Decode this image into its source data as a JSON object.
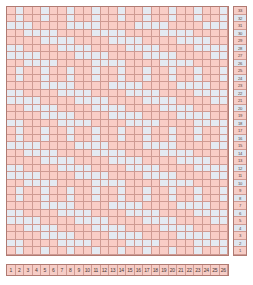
{
  "colors": {
    "warp": "#f9cdc6",
    "weft": "#e4eaf2",
    "grid_line": "#cf9a92",
    "border": "#b07a72",
    "ruler_odd": "#f6cdc6",
    "ruler_even": "#dfe6ef",
    "text": "#4a3734",
    "background": "#ffffff"
  },
  "grid": {
    "columns": 26,
    "rows": 33,
    "cell_width_px": 8.5,
    "cell_height_px": 7.5,
    "legend": {
      "warp_label": "warp (pink)",
      "weft_label": "weft (light blue)"
    }
  },
  "column_ruler": {
    "name": "column-numbers",
    "labels": [
      "1",
      "2",
      "3",
      "4",
      "5",
      "6",
      "7",
      "8",
      "9",
      "10",
      "11",
      "12",
      "13",
      "14",
      "15",
      "16",
      "17",
      "18",
      "19",
      "20",
      "21",
      "22",
      "23",
      "24",
      "25",
      "26"
    ]
  },
  "row_ruler": {
    "name": "row-numbers",
    "labels": [
      "33",
      "32",
      "31",
      "30",
      "29",
      "28",
      "27",
      "26",
      "25",
      "24",
      "23",
      "22",
      "21",
      "20",
      "19",
      "18",
      "17",
      "16",
      "15",
      "14",
      "13",
      "12",
      "11",
      "10",
      "9",
      "8",
      "7",
      "6",
      "5",
      "4",
      "3",
      "2",
      "1"
    ]
  },
  "chart_data": {
    "type": "heatmap",
    "xlabel": "",
    "ylabel": "",
    "categories": [
      "1",
      "2",
      "3",
      "4",
      "5",
      "6",
      "7",
      "8",
      "9",
      "10",
      "11",
      "12",
      "13",
      "14",
      "15",
      "16",
      "17",
      "18",
      "19",
      "20",
      "21",
      "22",
      "23",
      "24",
      "25",
      "26"
    ],
    "value_map": {
      "1": "warp",
      "0": "weft"
    },
    "matrix": [
      [
        1,
        0,
        1,
        1,
        0,
        1,
        1,
        0,
        1,
        1,
        0,
        1,
        1,
        0,
        1,
        1,
        0,
        1,
        1,
        0,
        1,
        1,
        0,
        1,
        1,
        0
      ],
      [
        1,
        0,
        1,
        1,
        0,
        1,
        1,
        0,
        1,
        1,
        0,
        1,
        1,
        0,
        1,
        1,
        0,
        1,
        1,
        0,
        1,
        1,
        0,
        1,
        1,
        0
      ],
      [
        0,
        0,
        0,
        1,
        1,
        1,
        1,
        0,
        0,
        0,
        0,
        1,
        1,
        1,
        1,
        0,
        0,
        0,
        0,
        1,
        1,
        1,
        1,
        0,
        0,
        0
      ],
      [
        1,
        1,
        0,
        0,
        0,
        0,
        1,
        1,
        1,
        1,
        0,
        0,
        0,
        0,
        1,
        1,
        1,
        1,
        0,
        0,
        0,
        0,
        1,
        1,
        1,
        1
      ],
      [
        1,
        1,
        1,
        1,
        0,
        0,
        0,
        0,
        1,
        1,
        1,
        1,
        0,
        0,
        0,
        0,
        1,
        1,
        1,
        1,
        0,
        0,
        0,
        0,
        1,
        1
      ],
      [
        0,
        0,
        1,
        1,
        1,
        1,
        0,
        0,
        0,
        0,
        1,
        1,
        1,
        1,
        0,
        0,
        0,
        0,
        1,
        1,
        1,
        1,
        0,
        0,
        0,
        0
      ],
      [
        0,
        0,
        0,
        0,
        1,
        1,
        1,
        1,
        0,
        0,
        0,
        0,
        1,
        1,
        1,
        1,
        0,
        0,
        0,
        0,
        1,
        1,
        1,
        1,
        0,
        0
      ],
      [
        1,
        1,
        0,
        0,
        0,
        0,
        1,
        1,
        1,
        1,
        0,
        0,
        0,
        0,
        1,
        1,
        1,
        1,
        0,
        0,
        0,
        0,
        1,
        1,
        1,
        1
      ],
      [
        1,
        0,
        1,
        1,
        0,
        1,
        1,
        0,
        1,
        1,
        0,
        1,
        1,
        0,
        1,
        1,
        0,
        1,
        1,
        0,
        1,
        1,
        0,
        1,
        1,
        0
      ],
      [
        1,
        0,
        1,
        1,
        0,
        1,
        1,
        0,
        1,
        1,
        0,
        1,
        1,
        0,
        1,
        1,
        0,
        1,
        1,
        0,
        1,
        1,
        0,
        1,
        1,
        0
      ],
      [
        1,
        1,
        1,
        1,
        0,
        0,
        0,
        0,
        1,
        1,
        1,
        1,
        0,
        0,
        0,
        0,
        1,
        1,
        1,
        1,
        0,
        0,
        0,
        0,
        1,
        1
      ],
      [
        0,
        0,
        1,
        1,
        1,
        1,
        0,
        0,
        0,
        0,
        1,
        1,
        1,
        1,
        0,
        0,
        0,
        0,
        1,
        1,
        1,
        1,
        0,
        0,
        0,
        0
      ],
      [
        0,
        0,
        0,
        0,
        1,
        1,
        1,
        1,
        0,
        0,
        0,
        0,
        1,
        1,
        1,
        1,
        0,
        0,
        0,
        0,
        1,
        1,
        1,
        1,
        0,
        0
      ],
      [
        1,
        1,
        0,
        0,
        0,
        0,
        1,
        1,
        1,
        1,
        0,
        0,
        0,
        0,
        1,
        1,
        1,
        1,
        0,
        0,
        0,
        0,
        1,
        1,
        1,
        1
      ],
      [
        1,
        1,
        1,
        1,
        0,
        0,
        0,
        0,
        1,
        1,
        1,
        1,
        0,
        0,
        0,
        0,
        1,
        1,
        1,
        1,
        0,
        0,
        0,
        0,
        1,
        1
      ],
      [
        0,
        0,
        1,
        1,
        1,
        1,
        0,
        0,
        0,
        0,
        1,
        1,
        1,
        1,
        0,
        0,
        0,
        0,
        1,
        1,
        1,
        1,
        0,
        0,
        0,
        0
      ],
      [
        1,
        0,
        1,
        1,
        0,
        1,
        1,
        0,
        1,
        1,
        0,
        1,
        1,
        0,
        1,
        1,
        0,
        1,
        1,
        0,
        1,
        1,
        0,
        1,
        1,
        0
      ],
      [
        1,
        0,
        1,
        1,
        0,
        1,
        1,
        0,
        1,
        1,
        0,
        1,
        1,
        0,
        1,
        1,
        0,
        1,
        1,
        0,
        1,
        1,
        0,
        1,
        1,
        0
      ],
      [
        0,
        0,
        0,
        0,
        1,
        1,
        1,
        1,
        0,
        0,
        0,
        0,
        1,
        1,
        1,
        1,
        0,
        0,
        0,
        0,
        1,
        1,
        1,
        1,
        0,
        0
      ],
      [
        1,
        1,
        0,
        0,
        0,
        0,
        1,
        1,
        1,
        1,
        0,
        0,
        0,
        0,
        1,
        1,
        1,
        1,
        0,
        0,
        0,
        0,
        1,
        1,
        1,
        1
      ],
      [
        1,
        1,
        1,
        1,
        0,
        0,
        0,
        0,
        1,
        1,
        1,
        1,
        0,
        0,
        0,
        0,
        1,
        1,
        1,
        1,
        0,
        0,
        0,
        0,
        1,
        1
      ],
      [
        0,
        0,
        1,
        1,
        1,
        1,
        0,
        0,
        0,
        0,
        1,
        1,
        1,
        1,
        0,
        0,
        0,
        0,
        1,
        1,
        1,
        1,
        0,
        0,
        0,
        0
      ],
      [
        0,
        0,
        0,
        0,
        1,
        1,
        1,
        1,
        0,
        0,
        0,
        0,
        1,
        1,
        1,
        1,
        0,
        0,
        0,
        0,
        1,
        1,
        1,
        1,
        0,
        0
      ],
      [
        1,
        1,
        0,
        0,
        0,
        0,
        1,
        1,
        1,
        1,
        0,
        0,
        0,
        0,
        1,
        1,
        1,
        1,
        0,
        0,
        0,
        0,
        1,
        1,
        1,
        1
      ],
      [
        1,
        0,
        1,
        1,
        0,
        1,
        1,
        0,
        1,
        1,
        0,
        1,
        1,
        0,
        1,
        1,
        0,
        1,
        1,
        0,
        1,
        1,
        0,
        1,
        1,
        0
      ],
      [
        1,
        0,
        1,
        1,
        0,
        1,
        1,
        0,
        1,
        1,
        0,
        1,
        1,
        0,
        1,
        1,
        0,
        1,
        1,
        0,
        1,
        1,
        0,
        1,
        1,
        0
      ],
      [
        1,
        1,
        1,
        1,
        0,
        0,
        0,
        0,
        1,
        1,
        1,
        1,
        0,
        0,
        0,
        0,
        1,
        1,
        1,
        1,
        0,
        0,
        0,
        0,
        1,
        1
      ],
      [
        0,
        0,
        1,
        1,
        1,
        1,
        0,
        0,
        0,
        0,
        1,
        1,
        1,
        1,
        0,
        0,
        0,
        0,
        1,
        1,
        1,
        1,
        0,
        0,
        0,
        0
      ],
      [
        0,
        0,
        0,
        0,
        1,
        1,
        1,
        1,
        0,
        0,
        0,
        0,
        1,
        1,
        1,
        1,
        0,
        0,
        0,
        0,
        1,
        1,
        1,
        1,
        0,
        0
      ],
      [
        1,
        1,
        0,
        0,
        0,
        0,
        1,
        1,
        1,
        1,
        0,
        0,
        0,
        0,
        1,
        1,
        1,
        1,
        0,
        0,
        0,
        0,
        1,
        1,
        1,
        1
      ],
      [
        1,
        1,
        1,
        1,
        0,
        0,
        0,
        0,
        1,
        1,
        1,
        1,
        0,
        0,
        0,
        0,
        1,
        1,
        1,
        1,
        0,
        0,
        0,
        0,
        1,
        1
      ],
      [
        0,
        0,
        1,
        1,
        1,
        1,
        0,
        0,
        0,
        0,
        1,
        1,
        1,
        1,
        0,
        0,
        0,
        0,
        1,
        1,
        1,
        1,
        0,
        0,
        0,
        0
      ],
      [
        1,
        0,
        1,
        1,
        0,
        1,
        1,
        0,
        1,
        1,
        0,
        1,
        1,
        0,
        1,
        1,
        0,
        1,
        1,
        0,
        1,
        1,
        0,
        1,
        1,
        0
      ]
    ]
  }
}
